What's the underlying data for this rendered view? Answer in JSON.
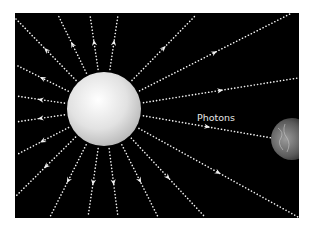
{
  "diagram": {
    "label": "Photons",
    "colors": {
      "background": "#000000",
      "page": "#ffffff",
      "ray": "#f2f2f2",
      "sun_light": "#ffffff",
      "sun_dark": "#b8b8b8"
    },
    "sun": {
      "cx": 104,
      "cy": 109,
      "r": 37
    },
    "earth": {
      "cx": 292,
      "cy": 139,
      "r": 21
    },
    "rays": [
      {
        "x": 16,
        "y": 19
      },
      {
        "x": 58,
        "y": 15
      },
      {
        "x": 90,
        "y": 15
      },
      {
        "x": 118,
        "y": 15
      },
      {
        "x": 196,
        "y": 15
      },
      {
        "x": 290,
        "y": 14
      },
      {
        "x": 298,
        "y": 78
      },
      {
        "x": 272,
        "y": 138
      },
      {
        "x": 298,
        "y": 217
      },
      {
        "x": 205,
        "y": 217
      },
      {
        "x": 158,
        "y": 217
      },
      {
        "x": 118,
        "y": 217
      },
      {
        "x": 88,
        "y": 217
      },
      {
        "x": 50,
        "y": 217
      },
      {
        "x": 16,
        "y": 196
      },
      {
        "x": 16,
        "y": 155
      },
      {
        "x": 16,
        "y": 122
      },
      {
        "x": 16,
        "y": 96
      },
      {
        "x": 16,
        "y": 65
      }
    ]
  }
}
